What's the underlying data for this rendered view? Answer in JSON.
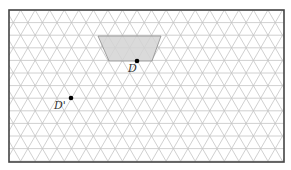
{
  "diagram": {
    "type": "triangular-grid",
    "frame": {
      "x": 9,
      "y": 10,
      "width": 275,
      "height": 152
    },
    "grid": {
      "row_spacing": 12.6,
      "side": 14.55,
      "line_color": "#c4c4c4"
    },
    "shape": {
      "name": "trapezoid",
      "fill": "#d4d4d4",
      "stroke": "#8a8a8a",
      "points": [
        [
          98,
          36
        ],
        [
          161,
          36
        ],
        [
          152,
          61
        ],
        [
          109,
          61
        ]
      ]
    },
    "points": [
      {
        "label": "D",
        "x": 137,
        "y": 61,
        "label_dx": -9,
        "label_dy": 11
      },
      {
        "label": "D'",
        "x": 71,
        "y": 98,
        "label_dx": -17,
        "label_dy": 11
      }
    ]
  }
}
